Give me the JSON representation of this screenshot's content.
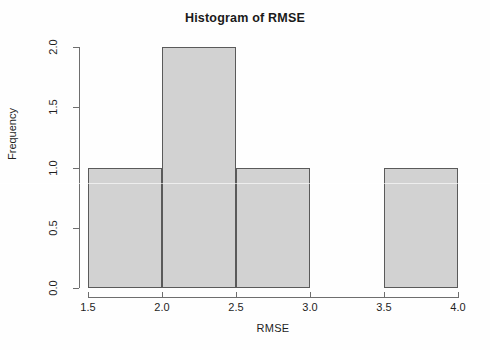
{
  "chart_data": {
    "type": "bar",
    "title": "Histogram of RMSE",
    "xlabel": "RMSE",
    "ylabel": "Frequency",
    "xlim": [
      1.5,
      4.0
    ],
    "ylim": [
      0.0,
      2.0
    ],
    "grid": false,
    "legend": false,
    "bin_width": 0.5,
    "bin_edges": [
      1.5,
      2.0,
      2.5,
      3.0,
      3.5,
      4.0
    ],
    "categories": [
      "1.5-2.0",
      "2.0-2.5",
      "2.5-3.0",
      "3.0-3.5",
      "3.5-4.0"
    ],
    "values": [
      1,
      2,
      1,
      0,
      1
    ],
    "bars": [
      {
        "label": "1.5-2.0",
        "x0": 1.5,
        "x1": 2.0,
        "value": 1
      },
      {
        "label": "2.0-2.5",
        "x0": 2.0,
        "x1": 2.5,
        "value": 2
      },
      {
        "label": "2.5-3.0",
        "x0": 2.5,
        "x1": 3.0,
        "value": 1
      },
      {
        "label": "3.0-3.5",
        "x0": 3.0,
        "x1": 3.5,
        "value": 0
      },
      {
        "label": "3.5-4.0",
        "x0": 3.5,
        "x1": 4.0,
        "value": 1
      }
    ],
    "xticks": [
      {
        "value": 1.5,
        "label": "1.5"
      },
      {
        "value": 2.0,
        "label": "2.0"
      },
      {
        "value": 2.5,
        "label": "2.5"
      },
      {
        "value": 3.0,
        "label": "3.0"
      },
      {
        "value": 3.5,
        "label": "3.5"
      },
      {
        "value": 4.0,
        "label": "4.0"
      }
    ],
    "yticks": [
      {
        "value": 0.0,
        "label": "0.0"
      },
      {
        "value": 0.5,
        "label": "0.5"
      },
      {
        "value": 1.0,
        "label": "1.0"
      },
      {
        "value": 1.5,
        "label": "1.5"
      },
      {
        "value": 2.0,
        "label": "2.0"
      }
    ],
    "colors": {
      "bar_fill": "#d2d2d2",
      "bar_border": "#5a5a5a",
      "axis": "#6e6e6e",
      "text": "#1f1f1f",
      "title": "#1a1a1a",
      "background": "#fefefe"
    }
  }
}
